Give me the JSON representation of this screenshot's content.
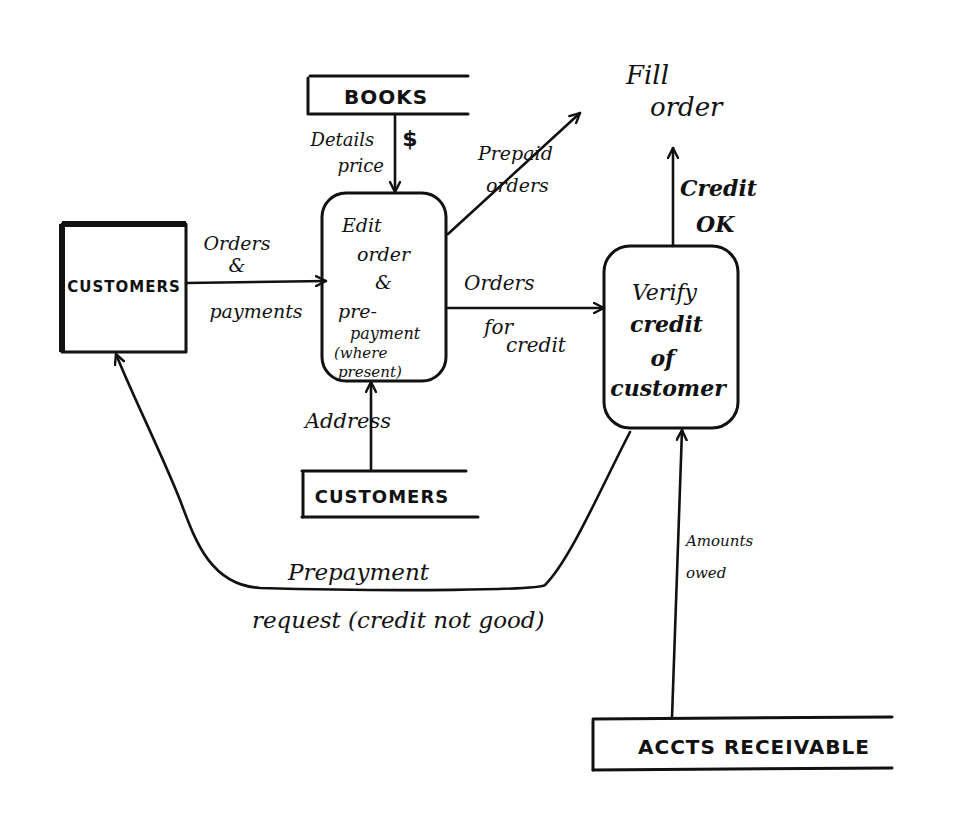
{
  "diagram": {
    "type": "data-flow-diagram",
    "colors": {
      "ink": "#111111",
      "paper": "#ffffff"
    },
    "external_entities": [
      {
        "id": "customers-entity",
        "label": "CUSTOMERS"
      }
    ],
    "processes": [
      {
        "id": "edit-order",
        "lines": [
          "Edit",
          "order",
          "&",
          "pre-",
          "payment",
          "(where",
          "present)"
        ]
      },
      {
        "id": "verify-credit",
        "lines": [
          "Verify",
          "credit",
          "of",
          "customer"
        ]
      }
    ],
    "data_stores": [
      {
        "id": "books-store",
        "label": "BOOKS"
      },
      {
        "id": "customers-store",
        "label": "CUSTOMERS"
      },
      {
        "id": "accts-receivable-store",
        "label": "ACCTS RECEIVABLE"
      }
    ],
    "sinks": [
      {
        "id": "fill-order",
        "lines": [
          "Fill",
          "order"
        ]
      }
    ],
    "flows": [
      {
        "id": "orders-payments",
        "from": "customers-entity",
        "to": "edit-order",
        "lines": [
          "Orders",
          "&",
          "payments"
        ]
      },
      {
        "id": "details-price",
        "from": "books-store",
        "to": "edit-order",
        "lines": [
          "Details",
          "price"
        ],
        "mark": "$"
      },
      {
        "id": "prepaid-orders",
        "from": "edit-order",
        "to": "fill-order",
        "lines": [
          "Prepaid",
          "orders"
        ]
      },
      {
        "id": "orders-for-credit",
        "from": "edit-order",
        "to": "verify-credit",
        "lines": [
          "Orders",
          "for",
          "credit"
        ]
      },
      {
        "id": "credit-ok",
        "from": "verify-credit",
        "to": "fill-order",
        "lines": [
          "Credit",
          "OK"
        ]
      },
      {
        "id": "address",
        "from": "customers-store",
        "to": "edit-order",
        "lines": [
          "Address"
        ]
      },
      {
        "id": "amounts-owed",
        "from": "accts-receivable-store",
        "to": "verify-credit",
        "lines": [
          "Amounts",
          "owed"
        ]
      },
      {
        "id": "prepayment-request",
        "from": "verify-credit",
        "to": "customers-entity",
        "lines": [
          "Prepayment",
          "request (credit not good)"
        ]
      }
    ]
  }
}
